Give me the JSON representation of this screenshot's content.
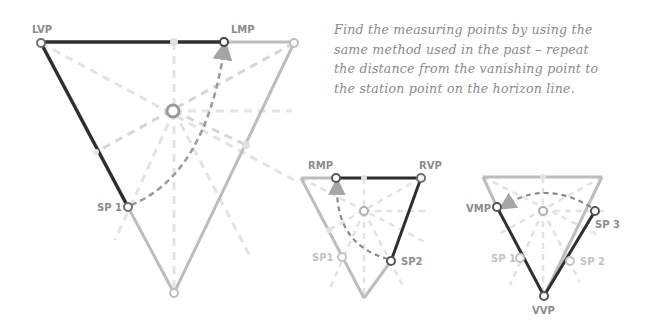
{
  "note": {
    "lines": [
      "Find the measuring points by using the",
      "same method used in the past – repeat",
      "the distance from the vanishing point to",
      "the station point on the horizon line."
    ]
  },
  "diagrams": [
    {
      "name": "three-point-left-measuring",
      "labels": {
        "lvp": "LVP",
        "lmp": "LMP",
        "sp1": "SP 1"
      }
    },
    {
      "name": "three-point-right-measuring",
      "labels": {
        "rmp": "RMP",
        "rvp": "RVP",
        "sp1": "SP1",
        "sp2": "SP2"
      }
    },
    {
      "name": "three-point-vertical-measuring",
      "labels": {
        "vmp": "VMP",
        "sp3": "SP 3",
        "sp1": "SP 1",
        "sp2": "SP 2",
        "vvp": "VVP"
      }
    }
  ],
  "colors": {
    "dark_line": "#2e2e2e",
    "mid_line": "#bdbdbd",
    "faint_dash": "#e2e2e2",
    "arc": "#8f8f8f",
    "text": "#8a8a8a"
  }
}
